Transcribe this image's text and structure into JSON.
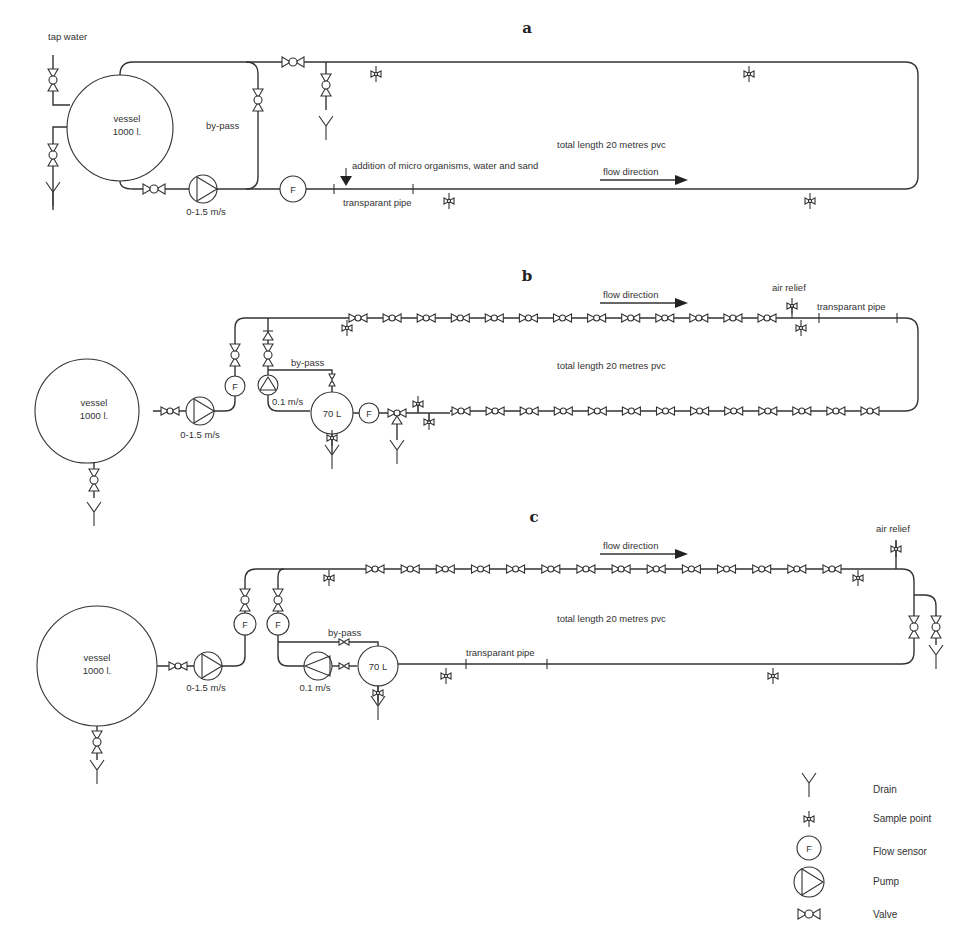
{
  "figure": {
    "panels": {
      "a": {
        "label": "a",
        "tap_water": "tap water",
        "vessel_line1": "vessel",
        "vessel_line2": "1000 l.",
        "bypass": "by-pass",
        "pump_speed": "0-1.5 m/s",
        "flow_sensor": "F",
        "addition": "addition of micro organisms, water and sand",
        "transparent_pipe": "transparant pipe",
        "total_length": "total length 20 metres pvc",
        "flow_direction": "flow direction"
      },
      "b": {
        "label": "b",
        "vessel_line1": "vessel",
        "vessel_line2": "1000 l.",
        "pump_speed": "0-1.5 m/s",
        "small_pump_speed": "0.1 m/s",
        "bypass": "by-pass",
        "small_vessel": "70 L",
        "flow_sensor": "F",
        "air_relief": "air relief",
        "transparent_pipe": "transparant pipe",
        "total_length": "total length 20 metres pvc",
        "flow_direction": "flow direction",
        "top_line_valves": 13,
        "bottom_line_valves": 13
      },
      "c": {
        "label": "c",
        "vessel_line1": "vessel",
        "vessel_line2": "1000 l.",
        "pump_speed": "0-1.5 m/s",
        "small_pump_speed": "0.1 m/s",
        "bypass": "by-pass",
        "small_vessel": "70 L",
        "flow_sensor": "F",
        "air_relief": "air relief",
        "transparent_pipe": "transparant pipe",
        "total_length": "total length 20 metres pvc",
        "flow_direction": "flow direction",
        "top_line_valves": 14
      }
    },
    "legend": [
      {
        "icon": "drain-icon",
        "label": "Drain"
      },
      {
        "icon": "sample-point-icon",
        "label": "Sample point"
      },
      {
        "icon": "flow-sensor-icon",
        "label": "Flow sensor",
        "glyph": "F"
      },
      {
        "icon": "pump-icon",
        "label": "Pump"
      },
      {
        "icon": "valve-icon",
        "label": "Valve"
      }
    ]
  }
}
